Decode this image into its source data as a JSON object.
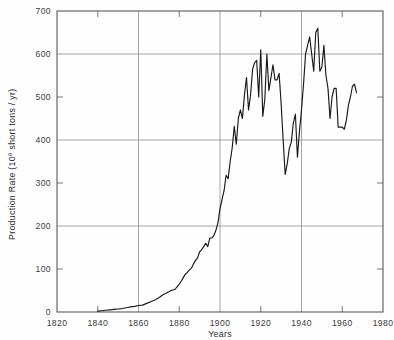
{
  "chart_data": {
    "type": "line",
    "title": "",
    "xlabel": "Years",
    "ylabel": "Production Rate (10⁶ short tons / yr)",
    "ylabel_main": "Production Rate (",
    "ylabel_unit_base": "10",
    "ylabel_unit_sup": "6",
    "ylabel_unit_rest": " short tons / yr)",
    "xlim": [
      1820,
      1980
    ],
    "ylim": [
      0,
      700
    ],
    "grid": "major-horizontal-and-vertical",
    "legend": "none",
    "xticks": [
      1820,
      1840,
      1860,
      1880,
      1900,
      1920,
      1940,
      1960,
      1980
    ],
    "xtick_labels": [
      "1820",
      "1840",
      "1860",
      "1880",
      "1900",
      "1920",
      "1940",
      "1960",
      "1980"
    ],
    "yticks": [
      0,
      100,
      200,
      300,
      400,
      500,
      600,
      700
    ],
    "ytick_labels": [
      "0",
      "100",
      "200",
      "300",
      "400",
      "500",
      "600",
      "700"
    ],
    "ygrid_major": [
      0,
      200,
      400,
      600
    ],
    "ygrid_minor_ticks": [
      100,
      300,
      500
    ],
    "xgrid_major": [
      1860,
      1900,
      1940
    ],
    "xgrid_minor_ticks": [
      1840,
      1880,
      1920,
      1960
    ],
    "series": [
      {
        "name": "Coal production rate",
        "color": "#1a1a1a",
        "x": [
          1840,
          1842,
          1844,
          1846,
          1848,
          1850,
          1852,
          1854,
          1856,
          1858,
          1860,
          1862,
          1864,
          1866,
          1868,
          1870,
          1872,
          1874,
          1876,
          1878,
          1880,
          1881,
          1882,
          1883,
          1884,
          1885,
          1886,
          1887,
          1888,
          1889,
          1890,
          1891,
          1892,
          1893,
          1894,
          1895,
          1896,
          1897,
          1898,
          1899,
          1900,
          1901,
          1902,
          1903,
          1904,
          1905,
          1906,
          1907,
          1908,
          1909,
          1910,
          1911,
          1912,
          1913,
          1914,
          1915,
          1916,
          1917,
          1918,
          1919,
          1920,
          1921,
          1922,
          1923,
          1924,
          1925,
          1926,
          1927,
          1928,
          1929,
          1930,
          1931,
          1932,
          1933,
          1934,
          1935,
          1936,
          1937,
          1938,
          1939,
          1940,
          1941,
          1942,
          1943,
          1944,
          1945,
          1946,
          1947,
          1948,
          1949,
          1950,
          1951,
          1952,
          1953,
          1954,
          1955,
          1956,
          1957,
          1958,
          1959,
          1960,
          1961,
          1962,
          1963,
          1964,
          1965,
          1966,
          1967
        ],
        "y": [
          2,
          3,
          4,
          5,
          6,
          7,
          8,
          10,
          12,
          13,
          15,
          16,
          20,
          24,
          28,
          33,
          40,
          45,
          50,
          53,
          65,
          72,
          80,
          88,
          92,
          98,
          102,
          112,
          120,
          126,
          140,
          145,
          152,
          160,
          152,
          172,
          172,
          178,
          190,
          208,
          240,
          262,
          282,
          318,
          310,
          350,
          382,
          432,
          390,
          450,
          470,
          450,
          505,
          545,
          470,
          505,
          565,
          580,
          585,
          500,
          610,
          455,
          495,
          600,
          515,
          545,
          575,
          540,
          540,
          555,
          485,
          400,
          320,
          345,
          380,
          395,
          440,
          460,
          360,
          420,
          470,
          530,
          600,
          620,
          640,
          600,
          560,
          650,
          660,
          560,
          570,
          620,
          550,
          520,
          450,
          500,
          520,
          520,
          430,
          430,
          430,
          425,
          445,
          480,
          500,
          525,
          530,
          510
        ]
      }
    ]
  },
  "axis": {
    "y_title_parts": {
      "pre": "Production Rate (",
      "base": "10",
      "sup": "6",
      "post": " short tons / yr)"
    },
    "x_title": "Years"
  }
}
